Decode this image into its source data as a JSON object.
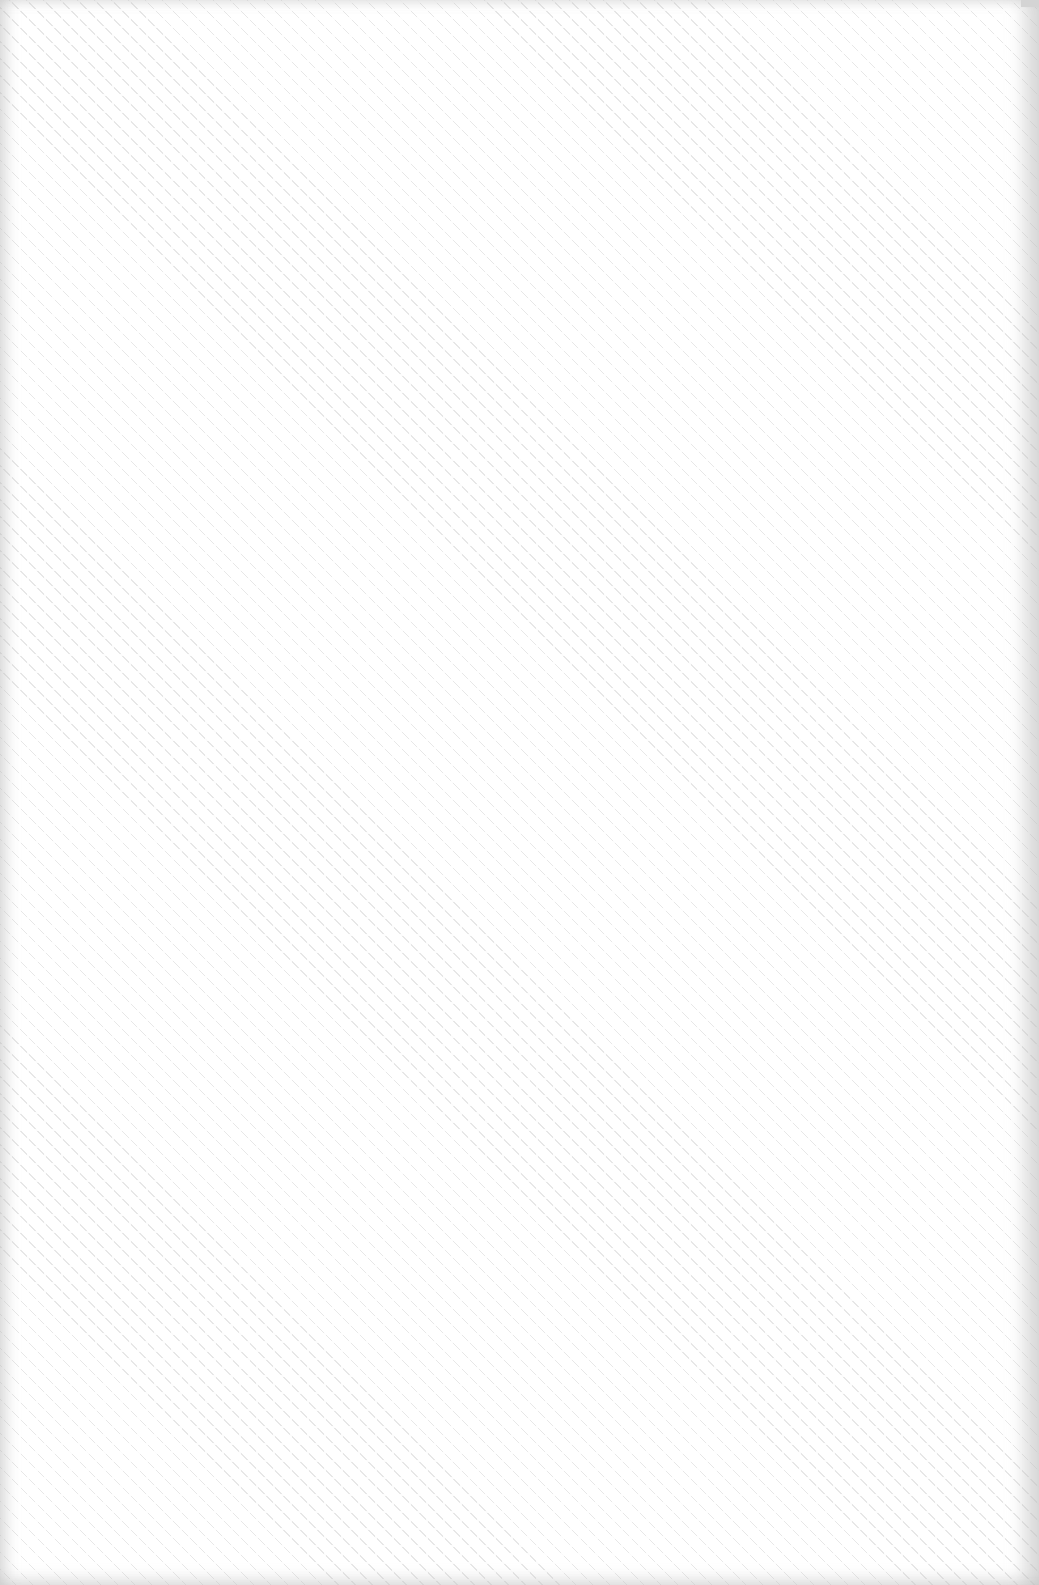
{
  "surface": {
    "background_color": "#ffffff",
    "hatch_color": "#aaaaaa",
    "edge_shade_color": "#bebebe",
    "corner_mark_color": "#d4d4d4"
  }
}
